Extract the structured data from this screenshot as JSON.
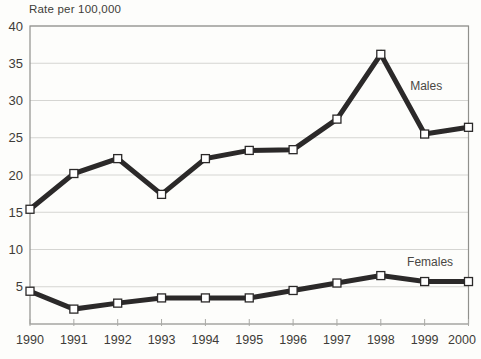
{
  "chart_data": {
    "type": "line",
    "title": "Rate per 100,000",
    "categories": [
      "1990",
      "1991",
      "1992",
      "1993",
      "1994",
      "1995",
      "1996",
      "1997",
      "1998",
      "1999",
      "2000"
    ],
    "series": [
      {
        "name": "Males",
        "label": "Males",
        "values": [
          15.4,
          20.2,
          22.2,
          17.4,
          22.2,
          23.3,
          23.4,
          27.5,
          36.2,
          25.5,
          26.4
        ],
        "label_anchor": {
          "x_index": 8.67,
          "y_value": 31.9
        }
      },
      {
        "name": "Females",
        "label": "Females",
        "values": [
          4.4,
          2.0,
          2.8,
          3.5,
          3.5,
          3.5,
          4.5,
          5.5,
          6.5,
          5.7,
          5.7
        ],
        "label_anchor": {
          "x_index": 8.6,
          "y_value": 8.3
        }
      }
    ],
    "xlabel": "",
    "ylabel": "Rate per 100,000",
    "ylim": [
      0,
      40
    ],
    "ytick_values": [
      5,
      10,
      15,
      20,
      25,
      30,
      35,
      40
    ],
    "grid": true,
    "legend_position": "inline-labels",
    "marker": "square-open",
    "colors": {
      "line": "#2b2929",
      "marker_fill": "#ffffff",
      "grid": "#d5d5d2",
      "border": "#90908c",
      "tick": "#a9a9a5",
      "text": "#3e3c38",
      "background": "#fdfdfb"
    }
  }
}
